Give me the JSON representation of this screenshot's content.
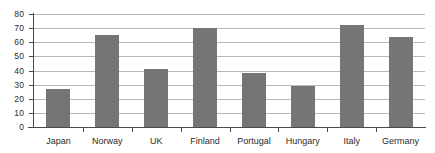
{
  "chart_data": {
    "type": "bar",
    "title": "",
    "subtitle": "",
    "xlabel": "",
    "ylabel": "",
    "categories": [
      "Japan",
      "Norway",
      "UK",
      "Finland",
      "Portugal",
      "Hungary",
      "Italy",
      "Germany"
    ],
    "values": [
      27,
      65,
      41,
      70,
      38,
      29,
      72,
      64
    ],
    "series": [
      {
        "name": "",
        "values": [
          27,
          65,
          41,
          70,
          38,
          29,
          72,
          64
        ]
      }
    ],
    "ylim": [
      0,
      80
    ],
    "yticks": [
      0,
      10,
      20,
      30,
      40,
      50,
      60,
      70,
      80
    ],
    "ytick_labels": [
      "0",
      "10",
      "20",
      "30",
      "40",
      "50",
      "60",
      "70",
      "80"
    ],
    "grid": true,
    "grid_axis": "y",
    "legend": false,
    "legend_position": "none",
    "bar_color": "#757575",
    "grid_color": "#b9b9b9",
    "axis_color": "#4a4a4a",
    "background_color": "#ffffff",
    "text_color": "#2b2b2b"
  }
}
